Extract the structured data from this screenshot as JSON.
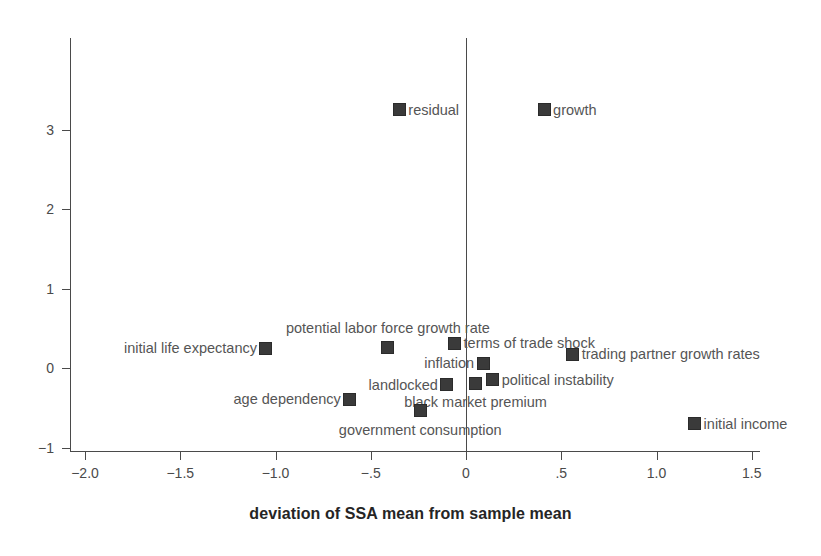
{
  "chart_data": {
    "type": "scatter",
    "title": "",
    "xlabel": "deviation of SSA mean from sample mean",
    "ylabel": "",
    "xlim": [
      -2.0,
      1.5
    ],
    "ylim": [
      -1.2,
      3.9
    ],
    "grid": false,
    "legend": "none (points labeled directly)",
    "xticks": [
      "-2.0",
      "-1.5",
      "-1.0",
      "-.5",
      "0",
      ".5",
      "1.0",
      "1.5"
    ],
    "xtick_values": [
      -2.0,
      -1.5,
      -1.0,
      -0.5,
      0,
      0.5,
      1.0,
      1.5
    ],
    "yticks": [
      "3",
      "2",
      "1",
      "0",
      "-1"
    ],
    "ytick_values": [
      3,
      2,
      1,
      0,
      -1
    ],
    "marker_color": "#3a3a3a",
    "axis_color": "#4a4a4a",
    "zero_reference_line_x": 0,
    "points": [
      {
        "label": "residual",
        "x": -0.35,
        "y": 3.25,
        "label_side": "right"
      },
      {
        "label": "growth",
        "x": 0.41,
        "y": 3.25,
        "label_side": "right"
      },
      {
        "label": "potential labor force growth rate",
        "x": -0.41,
        "y": 0.26,
        "label_side": "above"
      },
      {
        "label": "initial life expectancy",
        "x": -1.05,
        "y": 0.25,
        "label_side": "left"
      },
      {
        "label": "terms of trade shock",
        "x": -0.06,
        "y": 0.31,
        "label_side": "right"
      },
      {
        "label": "trading partner growth rates",
        "x": 0.56,
        "y": 0.17,
        "label_side": "right"
      },
      {
        "label": "inflation",
        "x": 0.09,
        "y": 0.06,
        "label_side": "left"
      },
      {
        "label": "political instability",
        "x": 0.14,
        "y": -0.15,
        "label_side": "right"
      },
      {
        "label": "landlocked",
        "x": -0.1,
        "y": -0.21,
        "label_side": "left"
      },
      {
        "label": "black market premium",
        "x": 0.05,
        "y": -0.19,
        "label_side": "below"
      },
      {
        "label": "age dependency",
        "x": -0.61,
        "y": -0.39,
        "label_side": "left"
      },
      {
        "label": "government consumption",
        "x": -0.24,
        "y": -0.54,
        "label_side": "below"
      },
      {
        "label": "initial income",
        "x": 1.2,
        "y": -0.7,
        "label_side": "right"
      }
    ]
  }
}
